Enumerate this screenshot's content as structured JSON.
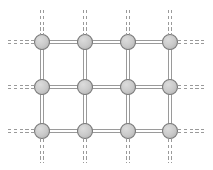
{
  "figure": {
    "width": 213,
    "height": 170,
    "background_color": "#ffffff"
  },
  "style": {
    "node_fill": "#c9c9c9",
    "node_stroke": "#7a7a7a",
    "node_radius": 7.5,
    "node_stroke_width": 1.1,
    "bond_color": "#9a9a9a",
    "bond_line_width": 1.0,
    "bond_gap": 3.2,
    "dangling_dash": "3.2 2.6"
  },
  "lattice": {
    "rows": 3,
    "columns": 4,
    "column_x": [
      42,
      85,
      128,
      170
    ],
    "row_y": [
      42,
      87,
      131
    ],
    "dangling_left_x": 8,
    "dangling_right_x": 205,
    "dangling_top_y": 10,
    "dangling_bottom_y": 163
  },
  "nodes": [
    {
      "id": "n-r0-c0",
      "label": "node-row0-col0",
      "row": 0,
      "col": 0,
      "x": 42,
      "y": 42
    },
    {
      "id": "n-r0-c1",
      "label": "node-row0-col1",
      "row": 0,
      "col": 1,
      "x": 85,
      "y": 42
    },
    {
      "id": "n-r0-c2",
      "label": "node-row0-col2",
      "row": 0,
      "col": 2,
      "x": 128,
      "y": 42
    },
    {
      "id": "n-r0-c3",
      "label": "node-row0-col3",
      "row": 0,
      "col": 3,
      "x": 170,
      "y": 42
    },
    {
      "id": "n-r1-c0",
      "label": "node-row1-col0",
      "row": 1,
      "col": 0,
      "x": 42,
      "y": 87
    },
    {
      "id": "n-r1-c1",
      "label": "node-row1-col1",
      "row": 1,
      "col": 1,
      "x": 85,
      "y": 87
    },
    {
      "id": "n-r1-c2",
      "label": "node-row1-col2",
      "row": 1,
      "col": 2,
      "x": 128,
      "y": 87
    },
    {
      "id": "n-r1-c3",
      "label": "node-row1-col3",
      "row": 1,
      "col": 3,
      "x": 170,
      "y": 87
    },
    {
      "id": "n-r2-c0",
      "label": "node-row2-col0",
      "row": 2,
      "col": 0,
      "x": 42,
      "y": 131
    },
    {
      "id": "n-r2-c1",
      "label": "node-row2-col1",
      "row": 2,
      "col": 1,
      "x": 85,
      "y": 131
    },
    {
      "id": "n-r2-c2",
      "label": "node-row2-col2",
      "row": 2,
      "col": 2,
      "x": 128,
      "y": 131
    },
    {
      "id": "n-r2-c3",
      "label": "node-row2-col3",
      "row": 2,
      "col": 3,
      "x": 170,
      "y": 131
    }
  ],
  "bonds_solid": [
    {
      "id": "b-h-r0-c0c1",
      "label": "bond-horizontal-row0-col0-col1",
      "orientation": "horizontal",
      "x1": 42,
      "y1": 42,
      "x2": 85,
      "y2": 42
    },
    {
      "id": "b-h-r0-c1c2",
      "label": "bond-horizontal-row0-col1-col2",
      "orientation": "horizontal",
      "x1": 85,
      "y1": 42,
      "x2": 128,
      "y2": 42
    },
    {
      "id": "b-h-r0-c2c3",
      "label": "bond-horizontal-row0-col2-col3",
      "orientation": "horizontal",
      "x1": 128,
      "y1": 42,
      "x2": 170,
      "y2": 42
    },
    {
      "id": "b-h-r1-c0c1",
      "label": "bond-horizontal-row1-col0-col1",
      "orientation": "horizontal",
      "x1": 42,
      "y1": 87,
      "x2": 85,
      "y2": 87
    },
    {
      "id": "b-h-r1-c1c2",
      "label": "bond-horizontal-row1-col1-col2",
      "orientation": "horizontal",
      "x1": 85,
      "y1": 87,
      "x2": 128,
      "y2": 87
    },
    {
      "id": "b-h-r1-c2c3",
      "label": "bond-horizontal-row1-col2-col3",
      "orientation": "horizontal",
      "x1": 128,
      "y1": 87,
      "x2": 170,
      "y2": 87
    },
    {
      "id": "b-h-r2-c0c1",
      "label": "bond-horizontal-row2-col0-col1",
      "orientation": "horizontal",
      "x1": 42,
      "y1": 131,
      "x2": 85,
      "y2": 131
    },
    {
      "id": "b-h-r2-c1c2",
      "label": "bond-horizontal-row2-col1-col2",
      "orientation": "horizontal",
      "x1": 85,
      "y1": 131,
      "x2": 128,
      "y2": 131
    },
    {
      "id": "b-h-r2-c2c3",
      "label": "bond-horizontal-row2-col2-col3",
      "orientation": "horizontal",
      "x1": 128,
      "y1": 131,
      "x2": 170,
      "y2": 131
    },
    {
      "id": "b-v-c0-r0r1",
      "label": "bond-vertical-col0-row0-row1",
      "orientation": "vertical",
      "x1": 42,
      "y1": 42,
      "x2": 42,
      "y2": 87
    },
    {
      "id": "b-v-c1-r0r1",
      "label": "bond-vertical-col1-row0-row1",
      "orientation": "vertical",
      "x1": 85,
      "y1": 42,
      "x2": 85,
      "y2": 87
    },
    {
      "id": "b-v-c2-r0r1",
      "label": "bond-vertical-col2-row0-row1",
      "orientation": "vertical",
      "x1": 128,
      "y1": 42,
      "x2": 128,
      "y2": 87
    },
    {
      "id": "b-v-c3-r0r1",
      "label": "bond-vertical-col3-row0-row1",
      "orientation": "vertical",
      "x1": 170,
      "y1": 42,
      "x2": 170,
      "y2": 87
    },
    {
      "id": "b-v-c0-r1r2",
      "label": "bond-vertical-col0-row1-row2",
      "orientation": "vertical",
      "x1": 42,
      "y1": 87,
      "x2": 42,
      "y2": 131
    },
    {
      "id": "b-v-c1-r1r2",
      "label": "bond-vertical-col1-row1-row2",
      "orientation": "vertical",
      "x1": 85,
      "y1": 87,
      "x2": 85,
      "y2": 131
    },
    {
      "id": "b-v-c2-r1r2",
      "label": "bond-vertical-col2-row1-row2",
      "orientation": "vertical",
      "x1": 128,
      "y1": 87,
      "x2": 128,
      "y2": 131
    },
    {
      "id": "b-v-c3-r1r2",
      "label": "bond-vertical-col3-row1-row2",
      "orientation": "vertical",
      "x1": 170,
      "y1": 87,
      "x2": 170,
      "y2": 131
    }
  ],
  "bonds_dangling": [
    {
      "id": "d-left-r0",
      "label": "dangling-bond-left-row0",
      "orientation": "horizontal",
      "x1": 8,
      "y1": 42,
      "x2": 34,
      "y2": 42
    },
    {
      "id": "d-left-r1",
      "label": "dangling-bond-left-row1",
      "orientation": "horizontal",
      "x1": 8,
      "y1": 87,
      "x2": 34,
      "y2": 87
    },
    {
      "id": "d-left-r2",
      "label": "dangling-bond-left-row2",
      "orientation": "horizontal",
      "x1": 8,
      "y1": 131,
      "x2": 34,
      "y2": 131
    },
    {
      "id": "d-right-r0",
      "label": "dangling-bond-right-row0",
      "orientation": "horizontal",
      "x1": 178,
      "y1": 42,
      "x2": 205,
      "y2": 42
    },
    {
      "id": "d-right-r1",
      "label": "dangling-bond-right-row1",
      "orientation": "horizontal",
      "x1": 178,
      "y1": 87,
      "x2": 205,
      "y2": 87
    },
    {
      "id": "d-right-r2",
      "label": "dangling-bond-right-row2",
      "orientation": "horizontal",
      "x1": 178,
      "y1": 131,
      "x2": 205,
      "y2": 131
    },
    {
      "id": "d-top-c0",
      "label": "dangling-bond-top-col0",
      "orientation": "vertical",
      "x1": 42,
      "y1": 10,
      "x2": 42,
      "y2": 34
    },
    {
      "id": "d-top-c1",
      "label": "dangling-bond-top-col1",
      "orientation": "vertical",
      "x1": 85,
      "y1": 10,
      "x2": 85,
      "y2": 34
    },
    {
      "id": "d-top-c2",
      "label": "dangling-bond-top-col2",
      "orientation": "vertical",
      "x1": 128,
      "y1": 10,
      "x2": 128,
      "y2": 34
    },
    {
      "id": "d-top-c3",
      "label": "dangling-bond-top-col3",
      "orientation": "vertical",
      "x1": 170,
      "y1": 10,
      "x2": 170,
      "y2": 34
    },
    {
      "id": "d-bot-c0",
      "label": "dangling-bond-bottom-col0",
      "orientation": "vertical",
      "x1": 42,
      "y1": 139,
      "x2": 42,
      "y2": 163
    },
    {
      "id": "d-bot-c1",
      "label": "dangling-bond-bottom-col1",
      "orientation": "vertical",
      "x1": 85,
      "y1": 139,
      "x2": 85,
      "y2": 163
    },
    {
      "id": "d-bot-c2",
      "label": "dangling-bond-bottom-col2",
      "orientation": "vertical",
      "x1": 128,
      "y1": 139,
      "x2": 128,
      "y2": 163
    },
    {
      "id": "d-bot-c3",
      "label": "dangling-bond-bottom-col3",
      "orientation": "vertical",
      "x1": 170,
      "y1": 139,
      "x2": 170,
      "y2": 163
    }
  ]
}
